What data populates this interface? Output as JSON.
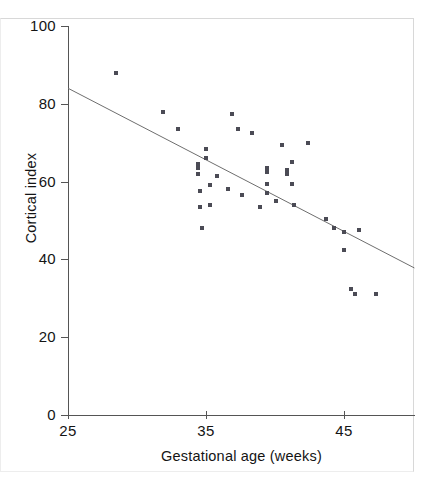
{
  "chart_data": {
    "type": "scatter",
    "title": "",
    "xlabel": "Gestational age (weeks)",
    "ylabel": "Cortical index",
    "xlim": [
      25,
      50.1
    ],
    "ylim": [
      0,
      100
    ],
    "xticks": [
      25,
      35,
      45
    ],
    "yticks": [
      0,
      20,
      40,
      60,
      80,
      100
    ],
    "xtick_labels": [
      "25",
      "35",
      "45"
    ],
    "ytick_labels": [
      "0",
      "20",
      "40",
      "60",
      "80",
      "100"
    ],
    "grid": false,
    "legend": null,
    "marker": "square",
    "marker_color": "#4b4b55",
    "line_color": "#6e6e6e",
    "axis_color": "#555555",
    "series": [
      {
        "name": "Cortical index vs gestational age",
        "points": [
          [
            28.5,
            88.0
          ],
          [
            31.9,
            78.0
          ],
          [
            33.0,
            73.5
          ],
          [
            34.4,
            64.5
          ],
          [
            34.4,
            63.5
          ],
          [
            34.4,
            62.0
          ],
          [
            34.6,
            57.5
          ],
          [
            34.6,
            53.5
          ],
          [
            34.7,
            48.0
          ],
          [
            35.0,
            68.5
          ],
          [
            35.0,
            66.0
          ],
          [
            35.3,
            59.0
          ],
          [
            35.3,
            54.0
          ],
          [
            35.8,
            61.5
          ],
          [
            36.6,
            58.0
          ],
          [
            36.9,
            77.5
          ],
          [
            37.3,
            73.5
          ],
          [
            37.6,
            56.5
          ],
          [
            38.3,
            72.5
          ],
          [
            38.9,
            53.5
          ],
          [
            39.4,
            63.5
          ],
          [
            39.4,
            62.5
          ],
          [
            39.4,
            59.5
          ],
          [
            39.4,
            57.0
          ],
          [
            40.1,
            55.0
          ],
          [
            40.5,
            69.5
          ],
          [
            40.9,
            63.0
          ],
          [
            40.9,
            62.0
          ],
          [
            41.2,
            65.0
          ],
          [
            41.2,
            59.5
          ],
          [
            41.4,
            54.0
          ],
          [
            42.4,
            70.0
          ],
          [
            43.7,
            50.5
          ],
          [
            44.3,
            48.0
          ],
          [
            45.0,
            47.0
          ],
          [
            45.0,
            42.5
          ],
          [
            45.5,
            32.5
          ],
          [
            45.8,
            31.0
          ],
          [
            46.1,
            47.5
          ],
          [
            47.3,
            31.0
          ]
        ]
      }
    ],
    "fit_line": {
      "name": "least-squares regression line",
      "x_start": 25.0,
      "y_start": 84.0,
      "x_end": 50.1,
      "y_end": 37.8
    }
  },
  "axes": {
    "y_title": "Cortical index",
    "x_title": "Gestational age (weeks)"
  }
}
